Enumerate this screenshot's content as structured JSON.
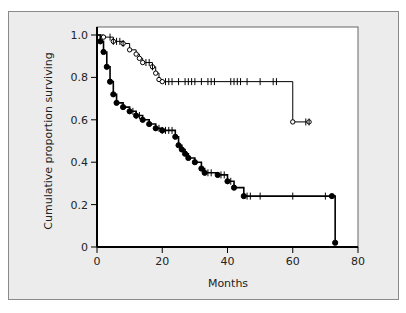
{
  "chart_data": {
    "type": "line",
    "subtype": "kaplan-meier",
    "title": "",
    "xlabel": "Months",
    "ylabel": "Cumulative proportion surviving",
    "xlim": [
      0,
      80
    ],
    "ylim": [
      0,
      1.0
    ],
    "xticks": [
      0,
      20,
      40,
      60,
      80
    ],
    "yticks": [
      0,
      0.2,
      0.4,
      0.6,
      0.8,
      1.0
    ],
    "ytick_labels": [
      "0",
      "0.2",
      "0.4",
      "0.6",
      "0.8",
      "1.0"
    ],
    "grid": false,
    "legend": null,
    "series": [
      {
        "name": "Group A (open circles)",
        "marker": "open-circle",
        "steps": [
          [
            0,
            1.0
          ],
          [
            2,
            0.99
          ],
          [
            5,
            0.97
          ],
          [
            8,
            0.96
          ],
          [
            10,
            0.93
          ],
          [
            12,
            0.91
          ],
          [
            13,
            0.89
          ],
          [
            14,
            0.87
          ],
          [
            17,
            0.85
          ],
          [
            18,
            0.82
          ],
          [
            19,
            0.79
          ],
          [
            20,
            0.78
          ],
          [
            60,
            0.59
          ],
          [
            65,
            0.59
          ]
        ],
        "censor_ticks": [
          4,
          5,
          6,
          7,
          8,
          15,
          16,
          17,
          21,
          22,
          23,
          25,
          27,
          28,
          29,
          30,
          32,
          34,
          35,
          36,
          41,
          42,
          43,
          44,
          46,
          50,
          54,
          55,
          64,
          65
        ]
      },
      {
        "name": "Group B (filled circles)",
        "marker": "filled-circle",
        "steps": [
          [
            0,
            1.0
          ],
          [
            1,
            0.97
          ],
          [
            2,
            0.92
          ],
          [
            3,
            0.85
          ],
          [
            4,
            0.78
          ],
          [
            5,
            0.72
          ],
          [
            6,
            0.68
          ],
          [
            8,
            0.66
          ],
          [
            10,
            0.64
          ],
          [
            12,
            0.62
          ],
          [
            14,
            0.6
          ],
          [
            16,
            0.58
          ],
          [
            18,
            0.56
          ],
          [
            20,
            0.55
          ],
          [
            24,
            0.52
          ],
          [
            25,
            0.48
          ],
          [
            26,
            0.46
          ],
          [
            27,
            0.44
          ],
          [
            28,
            0.42
          ],
          [
            30,
            0.4
          ],
          [
            32,
            0.37
          ],
          [
            33,
            0.35
          ],
          [
            37,
            0.34
          ],
          [
            40,
            0.31
          ],
          [
            42,
            0.28
          ],
          [
            45,
            0.24
          ],
          [
            72,
            0.24
          ],
          [
            73,
            0.02
          ]
        ],
        "censor_ticks": [
          11,
          12,
          13,
          19,
          20,
          21,
          22,
          23,
          34,
          35,
          38,
          39,
          41,
          46,
          47,
          50,
          60,
          70
        ]
      }
    ]
  }
}
